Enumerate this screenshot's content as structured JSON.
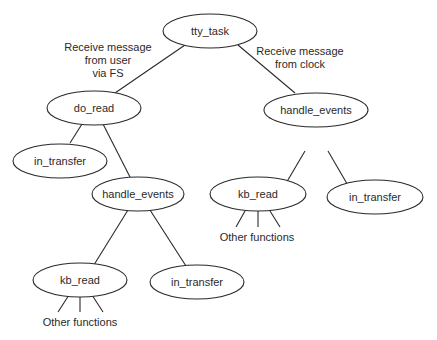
{
  "diagram": {
    "type": "call-tree",
    "nodes": [
      {
        "id": "tty_task",
        "label": "tty_task"
      },
      {
        "id": "do_read",
        "label": "do_read"
      },
      {
        "id": "handle_events_r",
        "label": "handle_events"
      },
      {
        "id": "in_transfer_1",
        "label": "in_transfer"
      },
      {
        "id": "handle_events_l",
        "label": "handle_events"
      },
      {
        "id": "kb_read_r",
        "label": "kb_read"
      },
      {
        "id": "in_transfer_r",
        "label": "in_transfer"
      },
      {
        "id": "kb_read_l",
        "label": "kb_read"
      },
      {
        "id": "in_transfer_l",
        "label": "in_transfer"
      }
    ],
    "edge_labels": {
      "left": [
        "Receive message",
        "from user",
        "via FS"
      ],
      "right": [
        "Receive message",
        "from clock"
      ]
    },
    "leaf_labels": {
      "other_functions_right": "Other functions",
      "other_functions_left": "Other functions"
    }
  }
}
